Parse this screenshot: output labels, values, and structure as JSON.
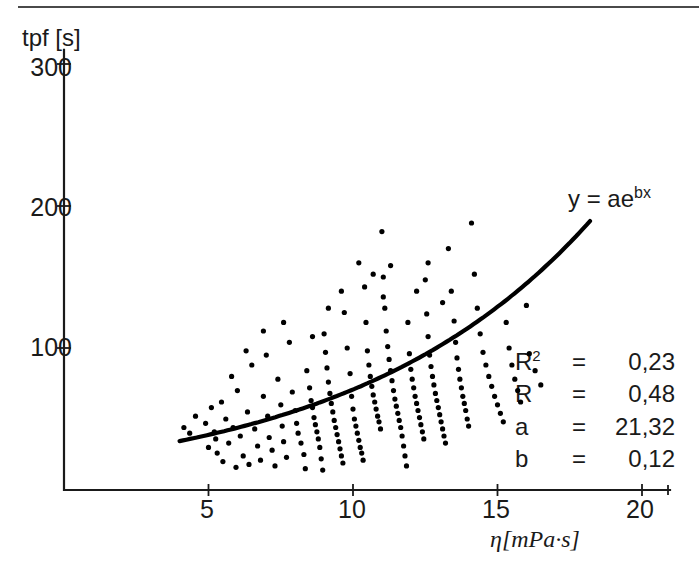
{
  "chart_data": {
    "type": "scatter",
    "title": "",
    "xlabel": "η[mPa·s]",
    "ylabel": "tpf [s]",
    "xlim": [
      0,
      21
    ],
    "ylim": [
      0,
      320
    ],
    "xticks": [
      5,
      10,
      15,
      20
    ],
    "yticks": [
      100,
      200,
      300
    ],
    "grid": false,
    "legend_position": "none",
    "annotations": {
      "equation": "y = ae",
      "equation_exponent": "bx"
    },
    "fit": {
      "model": "y = a*e^(b*x)",
      "a": 21.32,
      "b": 0.12,
      "r_squared": 0.23,
      "r": 0.48,
      "x_start": 4.0,
      "x_end": 18.2
    },
    "stats_rows": [
      {
        "symbol": "R",
        "symbol_sup": "2",
        "eq": "=",
        "value": "0,23"
      },
      {
        "symbol": "R",
        "symbol_sup": "",
        "eq": "=",
        "value": "0,48"
      },
      {
        "symbol": "a",
        "symbol_sup": "",
        "eq": "=",
        "value": "21,32"
      },
      {
        "symbol": "b",
        "symbol_sup": "",
        "eq": "=",
        "value": "0,12"
      }
    ],
    "series": [
      {
        "name": "measurements",
        "marker": "filled-circle",
        "color": "#000000",
        "points": [
          [
            4.15,
            44
          ],
          [
            4.35,
            40
          ],
          [
            4.55,
            52
          ],
          [
            4.9,
            47
          ],
          [
            5.0,
            30
          ],
          [
            5.1,
            58
          ],
          [
            5.2,
            41
          ],
          [
            5.25,
            36
          ],
          [
            5.3,
            26
          ],
          [
            5.45,
            62
          ],
          [
            5.5,
            20
          ],
          [
            5.6,
            50
          ],
          [
            5.7,
            33
          ],
          [
            5.85,
            44
          ],
          [
            5.95,
            16
          ],
          [
            6.0,
            70
          ],
          [
            6.1,
            38
          ],
          [
            6.2,
            24
          ],
          [
            6.35,
            55
          ],
          [
            6.4,
            18
          ],
          [
            6.5,
            88
          ],
          [
            6.6,
            43
          ],
          [
            6.7,
            31
          ],
          [
            6.8,
            21
          ],
          [
            6.9,
            66
          ],
          [
            7.0,
            95
          ],
          [
            7.05,
            52
          ],
          [
            7.1,
            37
          ],
          [
            7.2,
            28
          ],
          [
            7.3,
            17
          ],
          [
            7.4,
            78
          ],
          [
            7.5,
            60
          ],
          [
            7.55,
            45
          ],
          [
            7.6,
            34
          ],
          [
            7.7,
            23
          ],
          [
            7.8,
            104
          ],
          [
            7.9,
            69
          ],
          [
            8.0,
            56
          ],
          [
            8.05,
            47
          ],
          [
            8.1,
            40
          ],
          [
            8.2,
            33
          ],
          [
            8.3,
            25
          ],
          [
            8.35,
            15
          ],
          [
            8.4,
            84
          ],
          [
            8.5,
            72
          ],
          [
            8.55,
            63
          ],
          [
            8.6,
            58
          ],
          [
            8.65,
            51
          ],
          [
            8.7,
            46
          ],
          [
            8.75,
            41
          ],
          [
            8.8,
            36
          ],
          [
            8.85,
            30
          ],
          [
            8.9,
            22
          ],
          [
            8.95,
            14
          ],
          [
            9.0,
            110
          ],
          [
            9.05,
            97
          ],
          [
            9.1,
            86
          ],
          [
            9.15,
            76
          ],
          [
            9.2,
            68
          ],
          [
            9.25,
            61
          ],
          [
            9.3,
            55
          ],
          [
            9.35,
            49
          ],
          [
            9.4,
            44
          ],
          [
            9.45,
            39
          ],
          [
            9.5,
            34
          ],
          [
            9.55,
            29
          ],
          [
            9.6,
            24
          ],
          [
            9.65,
            19
          ],
          [
            9.7,
            125
          ],
          [
            9.8,
            100
          ],
          [
            9.9,
            82
          ],
          [
            9.95,
            66
          ],
          [
            10.0,
            57
          ],
          [
            10.05,
            50
          ],
          [
            10.1,
            45
          ],
          [
            10.15,
            40
          ],
          [
            10.2,
            35
          ],
          [
            10.25,
            30
          ],
          [
            10.3,
            26
          ],
          [
            10.35,
            21
          ],
          [
            10.4,
            143
          ],
          [
            10.45,
            118
          ],
          [
            10.5,
            98
          ],
          [
            10.55,
            88
          ],
          [
            10.6,
            80
          ],
          [
            10.65,
            73
          ],
          [
            10.7,
            67
          ],
          [
            10.75,
            62
          ],
          [
            10.8,
            57
          ],
          [
            10.85,
            52
          ],
          [
            10.9,
            48
          ],
          [
            10.95,
            43
          ],
          [
            11.0,
            182
          ],
          [
            11.05,
            150
          ],
          [
            11.1,
            128
          ],
          [
            11.15,
            112
          ],
          [
            11.2,
            101
          ],
          [
            11.25,
            92
          ],
          [
            11.3,
            84
          ],
          [
            11.35,
            77
          ],
          [
            11.4,
            70
          ],
          [
            11.45,
            64
          ],
          [
            11.5,
            59
          ],
          [
            11.55,
            54
          ],
          [
            11.6,
            49
          ],
          [
            11.65,
            44
          ],
          [
            11.7,
            38
          ],
          [
            11.75,
            31
          ],
          [
            11.8,
            24
          ],
          [
            11.85,
            17
          ],
          [
            11.9,
            118
          ],
          [
            11.95,
            96
          ],
          [
            12.0,
            85
          ],
          [
            12.05,
            78
          ],
          [
            12.1,
            72
          ],
          [
            12.15,
            66
          ],
          [
            12.2,
            61
          ],
          [
            12.25,
            56
          ],
          [
            12.3,
            51
          ],
          [
            12.35,
            46
          ],
          [
            12.4,
            41
          ],
          [
            12.45,
            36
          ],
          [
            12.5,
            148
          ],
          [
            12.55,
            124
          ],
          [
            12.6,
            108
          ],
          [
            12.65,
            95
          ],
          [
            12.7,
            87
          ],
          [
            12.75,
            80
          ],
          [
            12.8,
            74
          ],
          [
            12.85,
            68
          ],
          [
            12.9,
            63
          ],
          [
            12.95,
            58
          ],
          [
            13.0,
            53
          ],
          [
            13.05,
            48
          ],
          [
            13.1,
            43
          ],
          [
            13.15,
            38
          ],
          [
            13.2,
            33
          ],
          [
            13.3,
            170
          ],
          [
            13.4,
            140
          ],
          [
            13.5,
            119
          ],
          [
            13.55,
            104
          ],
          [
            13.6,
            93
          ],
          [
            13.65,
            85
          ],
          [
            13.7,
            78
          ],
          [
            13.75,
            72
          ],
          [
            13.8,
            66
          ],
          [
            13.85,
            61
          ],
          [
            13.9,
            56
          ],
          [
            13.95,
            50
          ],
          [
            14.0,
            45
          ],
          [
            14.1,
            188
          ],
          [
            14.2,
            152
          ],
          [
            14.3,
            128
          ],
          [
            14.4,
            110
          ],
          [
            14.5,
            97
          ],
          [
            14.6,
            88
          ],
          [
            14.7,
            80
          ],
          [
            14.8,
            73
          ],
          [
            14.9,
            66
          ],
          [
            15.0,
            60
          ],
          [
            15.1,
            54
          ],
          [
            15.2,
            48
          ],
          [
            15.3,
            118
          ],
          [
            15.4,
            100
          ],
          [
            15.5,
            88
          ],
          [
            15.6,
            78
          ],
          [
            15.7,
            70
          ],
          [
            15.8,
            62
          ],
          [
            16.0,
            130
          ],
          [
            16.1,
            96
          ],
          [
            16.3,
            84
          ],
          [
            16.5,
            74
          ],
          [
            12.2,
            140
          ],
          [
            11.3,
            158
          ],
          [
            10.2,
            160
          ],
          [
            9.6,
            140
          ],
          [
            8.6,
            108
          ],
          [
            7.6,
            118
          ],
          [
            6.9,
            112
          ],
          [
            6.3,
            98
          ],
          [
            5.8,
            80
          ],
          [
            12.6,
            160
          ],
          [
            13.1,
            132
          ],
          [
            11.05,
            136
          ],
          [
            9.15,
            128
          ],
          [
            10.7,
            152
          ]
        ]
      }
    ]
  }
}
